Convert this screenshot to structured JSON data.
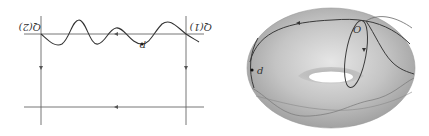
{
  "left_diagram": {
    "label_left": "Q(2)",
    "label_right": "Q(1)",
    "point_label": "p",
    "line_color": "#555555",
    "curve_color": "#333333"
  },
  "right_diagram": {
    "point_label": "d",
    "origin_label": "O",
    "surface_color": "#bdbdbd",
    "curve_color": "#3a3a3a"
  }
}
